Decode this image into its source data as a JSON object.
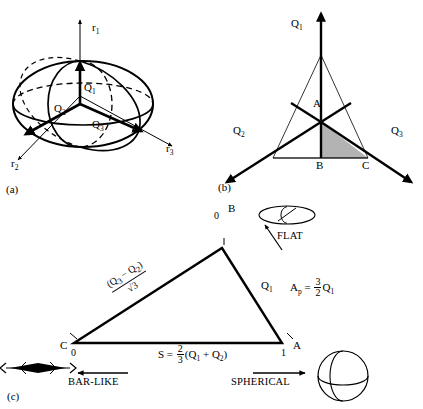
{
  "figure": {
    "panels": [
      {
        "tag": "(a)",
        "name": "ellipsoid-panel",
        "axes": [
          {
            "id": "r1",
            "label": "r",
            "sub": "1"
          },
          {
            "id": "r2",
            "label": "r",
            "sub": "2"
          },
          {
            "id": "r3",
            "label": "r",
            "sub": "3"
          }
        ],
        "vectors": [
          {
            "id": "Q1",
            "label": "Q",
            "sub": "1"
          },
          {
            "id": "Q2",
            "label": "Q",
            "sub": "2"
          },
          {
            "id": "Q3",
            "label": "Q",
            "sub": "3"
          }
        ]
      },
      {
        "tag": "(b)",
        "name": "ternary-axes-panel",
        "axis_labels": [
          {
            "id": "Q1",
            "label": "Q",
            "sub": "1"
          },
          {
            "id": "Q2",
            "label": "Q",
            "sub": "2"
          },
          {
            "id": "Q3",
            "label": "Q",
            "sub": "3"
          }
        ],
        "points": [
          {
            "id": "A",
            "label": "A"
          },
          {
            "id": "B",
            "label": "B"
          },
          {
            "id": "C",
            "label": "C"
          }
        ],
        "shaded_region_color": "#b3b3b3"
      },
      {
        "tag": "(c)",
        "name": "shape-triangle-panel",
        "vertices": [
          {
            "id": "B",
            "label": "B",
            "value": "0",
            "tick": "0"
          },
          {
            "id": "C",
            "label": "C",
            "value": "0",
            "tick": "1"
          },
          {
            "id": "A",
            "label": "A",
            "value": "1",
            "tick": "1"
          }
        ],
        "edge_labels": {
          "left": {
            "numerator_open": "(Q",
            "numerator_sub1": "3",
            "numerator_minus": " − Q",
            "numerator_sub2": "2",
            "numerator_close": ")",
            "denominator": "√3",
            "text": "(Q3 − Q2)/√3"
          },
          "right": {
            "label": "Q",
            "sub": "1"
          },
          "bottom": {
            "lhs": "S = ",
            "num": "2",
            "den": "3",
            "rhs_open": "(Q",
            "rhs_sub1": "1",
            "rhs_plus": " + Q",
            "rhs_sub2": "2",
            "rhs_close": ")",
            "text": "S = 2/3 (Q1 + Q2)"
          }
        },
        "formula": {
          "lhs": "A",
          "lhs_sub": "p",
          "eq": " = ",
          "num": "3",
          "den": "2",
          "rhs": "Q",
          "rhs_sub": "1",
          "text": "Ap = 3/2 Q1"
        },
        "annotations": [
          {
            "id": "flat",
            "label": "FLAT",
            "icon": "flat-disc-icon"
          },
          {
            "id": "bar-like",
            "label": "BAR-LIKE",
            "icon": "bar-needle-icon"
          },
          {
            "id": "spherical",
            "label": "SPHERICAL",
            "icon": "sphere-icon"
          }
        ]
      }
    ]
  }
}
